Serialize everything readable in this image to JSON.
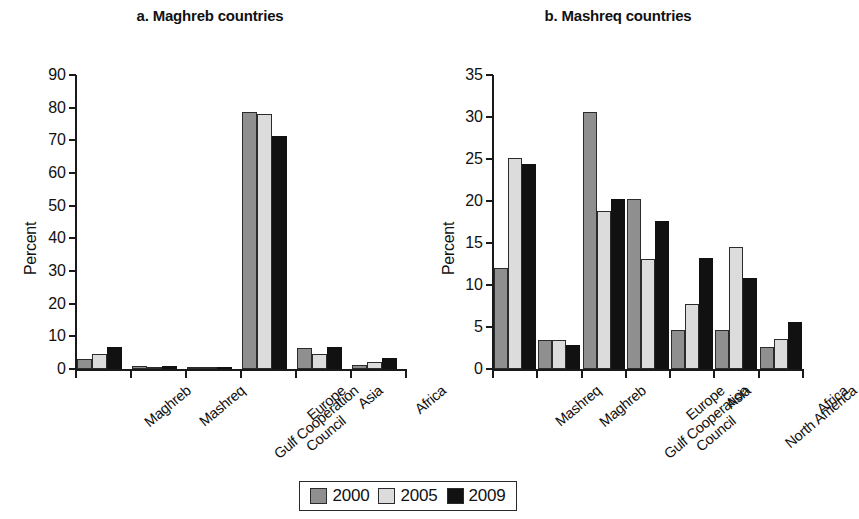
{
  "figure": {
    "legend": {
      "items": [
        {
          "label": "2000",
          "color": "#8f8f8f"
        },
        {
          "label": "2005",
          "color": "#dcdcdc"
        },
        {
          "label": "2009",
          "color": "#111111"
        }
      ]
    }
  },
  "chart_data": [
    {
      "type": "bar",
      "panel": "a",
      "title": "a. Maghreb countries",
      "xlabel": "",
      "ylabel": "Percent",
      "ylim": [
        0,
        90
      ],
      "ytick_step": 10,
      "yticks": [
        0,
        10,
        20,
        30,
        40,
        50,
        60,
        70,
        80,
        90
      ],
      "grid": false,
      "legend_position": "bottom-center",
      "categories": [
        "Maghreb",
        "Mashreq",
        "Gulf Cooperation Council",
        "Europe",
        "Asia",
        "Africa"
      ],
      "series": [
        {
          "name": "2000",
          "color": "#8f8f8f",
          "values": [
            3.2,
            0.8,
            0.3,
            78.6,
            6.5,
            1.2
          ]
        },
        {
          "name": "2005",
          "color": "#dcdcdc",
          "values": [
            4.6,
            0.7,
            0.3,
            78.1,
            4.6,
            2.1
          ]
        },
        {
          "name": "2009",
          "color": "#111111",
          "values": [
            6.8,
            0.9,
            0.3,
            71.3,
            6.6,
            3.5
          ]
        }
      ]
    },
    {
      "type": "bar",
      "panel": "b",
      "title": "b. Mashreq countries",
      "xlabel": "",
      "ylabel": "Percent",
      "ylim": [
        0,
        35
      ],
      "ytick_step": 5,
      "yticks": [
        0,
        5,
        10,
        15,
        20,
        25,
        30,
        35
      ],
      "grid": false,
      "legend_position": "bottom-center",
      "categories": [
        "Mashreq",
        "Maghreb",
        "Gulf Cooperation Council",
        "Europe",
        "Asia",
        "North America",
        "Africa"
      ],
      "series": [
        {
          "name": "2000",
          "color": "#8f8f8f",
          "values": [
            12.0,
            3.5,
            30.6,
            20.2,
            4.6,
            4.6,
            2.6
          ]
        },
        {
          "name": "2005",
          "color": "#dcdcdc",
          "values": [
            25.1,
            3.5,
            18.8,
            13.1,
            7.7,
            14.5,
            3.6
          ]
        },
        {
          "name": "2009",
          "color": "#111111",
          "values": [
            24.4,
            2.9,
            20.2,
            17.6,
            13.2,
            10.8,
            5.6
          ]
        }
      ]
    }
  ]
}
